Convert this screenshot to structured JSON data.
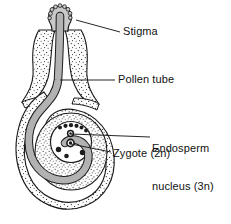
{
  "figure": {
    "width": 231,
    "height": 224,
    "background": "#ffffff"
  },
  "colors": {
    "outline": "#1a1a1a",
    "stipple_fill": "#fdfdfd",
    "stipple_dot": "#2b2b2b",
    "pollen_tube_fill": "#b2b2b2",
    "nucleus_fill": "#1c1c1c",
    "leader_line": "#1a1a1a",
    "text": "#111111"
  },
  "labels": [
    {
      "id": "stigma",
      "text": "Stigma",
      "x": 123,
      "y": 25,
      "leader_from": [
        118,
        32
      ],
      "leader_to": [
        75,
        20
      ]
    },
    {
      "id": "pollen-tube",
      "text": "Pollen tube",
      "x": 118,
      "y": 73,
      "leader_from": [
        114,
        80
      ],
      "leader_to": [
        60,
        80
      ]
    },
    {
      "id": "endosperm-nucleus",
      "text": "Endosperm\nnucleus (3n)",
      "line1": "Endosperm",
      "line2": "nucleus (3n)",
      "x": 152,
      "y": 117,
      "leader_from": [
        150,
        137
      ],
      "leader_to": [
        71,
        137
      ]
    },
    {
      "id": "zygote",
      "text": "Zygote (2n)",
      "x": 113,
      "y": 147,
      "leader_from": [
        110,
        153
      ],
      "leader_to": [
        70,
        150
      ]
    }
  ],
  "structures": [
    {
      "id": "stigma-head",
      "name": "stigma",
      "description": "bumpy bulbous head at top of style"
    },
    {
      "id": "style-wall",
      "name": "style",
      "description": "stippled tissue flaring downward from stigma"
    },
    {
      "id": "pollen-tube",
      "name": "pollen-tube",
      "description": "grey tube running from stigma down through style and coiling into the embryo sac"
    },
    {
      "id": "ovule-wall",
      "name": "ovule-integument",
      "description": "stippled curved outer wall enclosing the ovule"
    },
    {
      "id": "embryo-sac",
      "name": "embryo-sac",
      "description": "circular sac inside ovule containing nuclei"
    }
  ],
  "nuclei": [
    {
      "id": "n1",
      "cx": 60.0,
      "cy": 127.5,
      "r": 2.0,
      "role": "antipodal/polar group"
    },
    {
      "id": "n2",
      "cx": 65.5,
      "cy": 125.8,
      "r": 2.1,
      "role": "antipodal/polar group"
    },
    {
      "id": "n3",
      "cx": 71.0,
      "cy": 125.2,
      "r": 2.1,
      "role": "antipodal/polar group"
    },
    {
      "id": "n4",
      "cx": 76.5,
      "cy": 125.8,
      "r": 2.1,
      "role": "antipodal/polar group"
    },
    {
      "id": "n5",
      "cx": 81.5,
      "cy": 127.5,
      "r": 2.0,
      "role": "antipodal/polar group"
    },
    {
      "id": "n6",
      "cx": 86.0,
      "cy": 130.5,
      "r": 1.9,
      "role": "antipodal/polar group"
    },
    {
      "id": "n7",
      "cx": 70.5,
      "cy": 133.5,
      "r": 2.6,
      "role": "endosperm nucleus (3n)"
    },
    {
      "id": "n8",
      "cx": 70.5,
      "cy": 143.0,
      "r": 3.4,
      "role": "zygote (2n)"
    },
    {
      "id": "n9",
      "cx": 58.5,
      "cy": 149.5,
      "r": 2.6,
      "role": "synergid remnant"
    },
    {
      "id": "n10",
      "cx": 66.5,
      "cy": 156.0,
      "r": 2.3,
      "role": "synergid remnant"
    },
    {
      "id": "n11",
      "cx": 82.5,
      "cy": 152.5,
      "r": 2.6,
      "role": "synergid remnant"
    }
  ]
}
